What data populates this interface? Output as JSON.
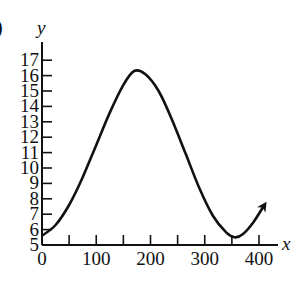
{
  "part_label": ")",
  "chart_data": {
    "type": "line",
    "title": "",
    "xlabel": "x",
    "ylabel": "y",
    "xlim": [
      0,
      400
    ],
    "ylim": [
      5,
      17
    ],
    "x_ticks": [
      0,
      50,
      100,
      150,
      200,
      250,
      300,
      350,
      400
    ],
    "x_tick_labels": [
      "0",
      "",
      "100",
      "",
      "200",
      "",
      "300",
      "",
      "400"
    ],
    "y_ticks": [
      5,
      6,
      7,
      8,
      9,
      10,
      11,
      12,
      13,
      14,
      15,
      16,
      17
    ],
    "y_tick_labels": [
      "5",
      "6",
      "7",
      "8",
      "9",
      "10",
      "11",
      "12",
      "13",
      "14",
      "15",
      "16",
      "17"
    ],
    "grid": false,
    "legend": null,
    "end_arrow": true,
    "series": [
      {
        "name": "curve",
        "description": "sinusoid: min ~5.5 near x=0, max ~16.3 near x=170, min ~5.5 near x=355, rising with arrow to ~(410, 7.5)",
        "x": [
          0,
          25,
          50,
          75,
          100,
          125,
          150,
          170,
          190,
          215,
          240,
          265,
          290,
          315,
          340,
          355,
          370,
          390,
          410
        ],
        "y": [
          5.6,
          6.3,
          7.6,
          9.4,
          11.5,
          13.6,
          15.4,
          16.3,
          16.1,
          15.0,
          13.1,
          10.9,
          8.7,
          6.9,
          5.8,
          5.5,
          5.7,
          6.5,
          7.6
        ]
      }
    ]
  }
}
